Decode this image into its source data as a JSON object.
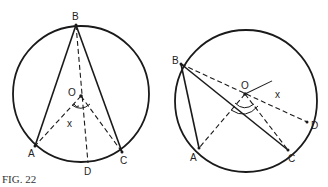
{
  "caption": "FIG. 22",
  "figure_left": {
    "labels": {
      "B": "B",
      "O": "O",
      "X": "x",
      "A": "A",
      "C": "C",
      "D": "D"
    },
    "points": {
      "center": [
        81,
        94
      ],
      "radius": 68,
      "B": [
        76,
        25
      ],
      "O": [
        81,
        96
      ],
      "A": [
        35,
        146
      ],
      "C": [
        122,
        152
      ],
      "D": [
        88,
        163
      ]
    }
  },
  "figure_right": {
    "labels": {
      "B": "B",
      "O": "O",
      "X": "x",
      "A": "A",
      "C": "C",
      "D": "D"
    },
    "points": {
      "center": [
        246,
        101
      ],
      "radius": 71,
      "B": [
        181,
        64
      ],
      "O": [
        245,
        94
      ],
      "A": [
        199,
        148
      ],
      "C": [
        288,
        150
      ],
      "D": [
        307,
        122
      ]
    }
  }
}
